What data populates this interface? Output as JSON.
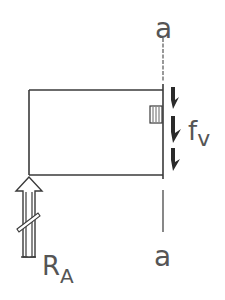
{
  "diagram": {
    "type": "free-body diagram",
    "section_label_top": "a",
    "section_label_bottom": "a",
    "shear_force_label": "f",
    "shear_force_subscript": "v",
    "reaction_label": "R",
    "reaction_subscript": "A",
    "colors": {
      "line": "#3a3a3a",
      "arrow_fill": "#2a2a2a",
      "text": "#555555",
      "background": "#ffffff"
    }
  }
}
